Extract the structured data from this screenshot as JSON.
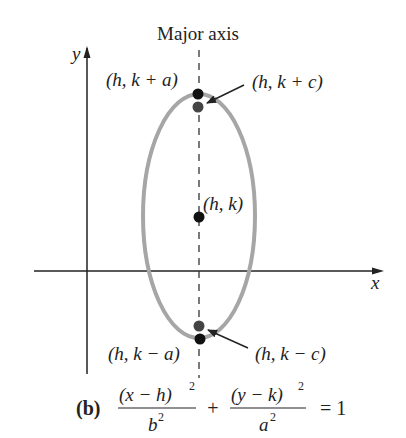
{
  "diagram": {
    "title": "Major axis",
    "axes": {
      "x_label": "x",
      "y_label": "y"
    },
    "points": {
      "top_vertex": "(h, k + a)",
      "top_focus": "(h, k + c)",
      "center": "(h, k)",
      "bottom_vertex": "(h, k − a)",
      "bottom_focus": "(h, k − c)"
    },
    "equation": {
      "part_label": "(b)",
      "term1_num": "(x − h)",
      "term1_num_exp": "2",
      "term1_den": "b",
      "term1_den_exp": "2",
      "plus": "+",
      "term2_num": "(y − k)",
      "term2_num_exp": "2",
      "term2_den": "a",
      "term2_den_exp": "2",
      "rhs": "= 1"
    },
    "colors": {
      "ellipse": "#a6a6a6",
      "vertex_dot": "#111111",
      "focus_dot": "#444444",
      "axes": "#222222"
    }
  }
}
